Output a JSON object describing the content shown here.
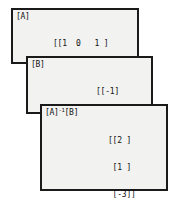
{
  "screen": {
    "width": 176,
    "height": 206,
    "background_color": "#ffffff",
    "panel_fill_color": "#f2f2f0",
    "panel_border_color": "#1a1a1a",
    "text_color": "#111111"
  },
  "panels": [
    {
      "id": "matrix-a",
      "label": "[A]",
      "label_exponent": "",
      "rows": [
        "[[1  0   1 ]",
        " [2  -2  -1]",
        " [3  0   0 ]]"
      ]
    },
    {
      "id": "matrix-b",
      "label": "[B]",
      "label_exponent": "",
      "rows": [
        "[[-1]",
        " [5 ]",
        " [6 ]]"
      ]
    },
    {
      "id": "matrix-a-inverse-times-b",
      "label": "[A]",
      "label_exponent": "-1",
      "label_suffix": "[B]",
      "rows": [
        "[[2 ]",
        " [1 ]",
        " [-3]]"
      ]
    }
  ],
  "caption": ""
}
